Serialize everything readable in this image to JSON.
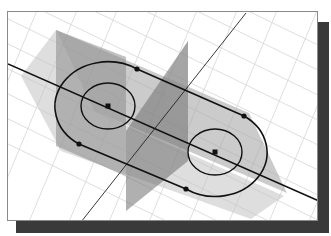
{
  "viewport": {
    "title": "",
    "background": "#ffffff",
    "frame_border": "#8a8a8a",
    "shadow_color": "#3a3a3a"
  },
  "scene": {
    "grid": {
      "visible": true,
      "color": "#d4d4d4"
    },
    "planes": [
      {
        "name": "horizontal-sketch-plane",
        "fill": "#9a9a9a",
        "opacity": 0.55
      },
      {
        "name": "vertical-plane-left",
        "fill": "#7a7a7a",
        "opacity": 0.55
      },
      {
        "name": "vertical-plane-center",
        "fill": "#6a6a6a",
        "opacity": 0.55
      }
    ],
    "axes": [
      {
        "name": "long-axis-line",
        "color": "#111111"
      },
      {
        "name": "diagonal-axis-line",
        "color": "#222222"
      }
    ],
    "sketch": {
      "profile": "slot",
      "circles": [
        {
          "name": "left-circle",
          "center_point": true
        },
        {
          "name": "right-circle",
          "center_point": true
        }
      ],
      "tangent_points": 4,
      "line_color": "#111111"
    }
  }
}
